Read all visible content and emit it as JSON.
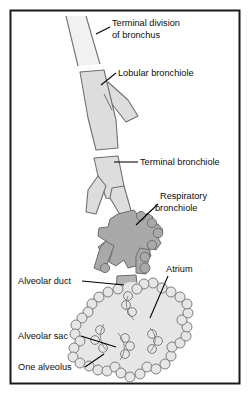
{
  "figure": {
    "frame": {
      "border_color": "#1a1a1a",
      "background": "#ffffff"
    },
    "colors": {
      "bronchus_fill": "#efefef",
      "bronchiole_fill": "#dcdcdc",
      "respiratory_bronchiole_fill": "#a9a9a9",
      "alveolar_duct_fill": "#b4b4b4",
      "alveolar_sac_fill": "#e4e4e4",
      "outline": "#595959",
      "label_text": "#0d0d0d",
      "leader_line": "#000000"
    }
  },
  "labels": [
    {
      "id": "terminal-division-of-bronchus",
      "lines": [
        "Terminal division",
        "of bronchus"
      ],
      "line1": "Terminal division",
      "line2": "of bronchus",
      "x": 112,
      "y": 26,
      "anchor": "start"
    },
    {
      "id": "lobular-bronchiole",
      "lines": [
        "Lobular bronchiole"
      ],
      "line1": "Lobular bronchiole",
      "line2": "",
      "x": 118,
      "y": 76,
      "anchor": "start"
    },
    {
      "id": "terminal-bronchiole",
      "lines": [
        "Terminal bronchiole"
      ],
      "line1": "Terminal bronchiole",
      "line2": "",
      "x": 140,
      "y": 165,
      "anchor": "start"
    },
    {
      "id": "respiratory-bronchiole",
      "lines": [
        "Respiratory",
        "bronchiole"
      ],
      "line1": "Respiratory",
      "line2": "bronchiole",
      "x": 160,
      "y": 199,
      "anchor": "start"
    },
    {
      "id": "alveolar-duct",
      "lines": [
        "Alveolar duct"
      ],
      "line1": "Alveolar duct",
      "line2": "",
      "x": 18,
      "y": 284,
      "anchor": "start"
    },
    {
      "id": "atrium",
      "lines": [
        "Atrium"
      ],
      "line1": "Atrium",
      "line2": "",
      "x": 166,
      "y": 272,
      "anchor": "start"
    },
    {
      "id": "alveolar-sac",
      "lines": [
        "Alveolar sac"
      ],
      "line1": "Alveolar sac",
      "line2": "",
      "x": 18,
      "y": 339,
      "anchor": "start"
    },
    {
      "id": "one-alveolus",
      "lines": [
        "One alveolus"
      ],
      "line1": "One alveolus",
      "line2": "",
      "x": 18,
      "y": 370,
      "anchor": "start"
    }
  ],
  "structures": [
    {
      "id": "terminal-division-of-bronchus",
      "name": "Terminal division of bronchus"
    },
    {
      "id": "lobular-bronchiole",
      "name": "Lobular bronchiole"
    },
    {
      "id": "terminal-bronchiole",
      "name": "Terminal bronchiole"
    },
    {
      "id": "respiratory-bronchiole",
      "name": "Respiratory bronchiole"
    },
    {
      "id": "alveolar-duct",
      "name": "Alveolar duct"
    },
    {
      "id": "atrium",
      "name": "Atrium"
    },
    {
      "id": "alveolar-sac",
      "name": "Alveolar sac"
    },
    {
      "id": "one-alveolus",
      "name": "One alveolus"
    }
  ]
}
